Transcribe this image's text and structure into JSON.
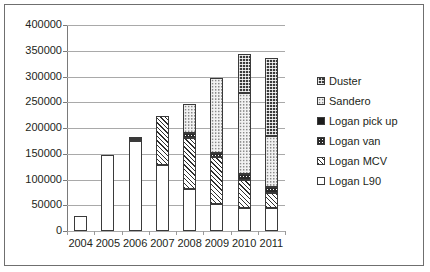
{
  "chart_data": {
    "type": "bar",
    "title": "",
    "xlabel": "",
    "ylabel": "",
    "stacked": true,
    "grid": true,
    "legend_position": "right",
    "ylim": [
      0,
      400000
    ],
    "ytick_step": 50000,
    "ytick_labels": [
      "400000",
      "350000",
      "300000",
      "250000",
      "200000",
      "150000",
      "100000",
      "50000",
      "0"
    ],
    "ytick_values": [
      400000,
      350000,
      300000,
      250000,
      200000,
      150000,
      100000,
      50000,
      0
    ],
    "categories": [
      "2004",
      "2005",
      "2006",
      "2007",
      "2008",
      "2009",
      "2010",
      "2011"
    ],
    "series": [
      {
        "name": "Logan L90",
        "pattern": "open",
        "values": [
          30000,
          148000,
          175000,
          128000,
          82000,
          52000,
          45000,
          45000
        ]
      },
      {
        "name": "Logan MCV",
        "pattern": "diagonal-hatch",
        "values": [
          0,
          0,
          4000,
          96000,
          98000,
          92000,
          55000,
          28000
        ]
      },
      {
        "name": "Logan van",
        "pattern": "dark-dotted",
        "values": [
          0,
          0,
          0,
          0,
          10000,
          8000,
          10000,
          12000
        ]
      },
      {
        "name": "Logan pick up",
        "pattern": "solid-dark",
        "values": [
          0,
          0,
          0,
          0,
          0,
          0,
          0,
          0
        ]
      },
      {
        "name": "Sandero",
        "pattern": "light-dotted",
        "values": [
          0,
          0,
          0,
          0,
          56000,
          146000,
          158000,
          99000
        ]
      },
      {
        "name": "Duster",
        "pattern": "checker-dark",
        "values": [
          0,
          0,
          2000,
          0,
          0,
          0,
          75000,
          152000
        ]
      }
    ],
    "totals": [
      30000,
      148000,
      181000,
      224000,
      246000,
      298000,
      343000,
      336000
    ]
  },
  "legend": {
    "items": [
      {
        "label": "Duster",
        "swatch": "checker-dark"
      },
      {
        "label": "Sandero",
        "swatch": "light-dotted"
      },
      {
        "label": "Logan pick up",
        "swatch": "solid-dark"
      },
      {
        "label": "Logan van",
        "swatch": "dark-dotted"
      },
      {
        "label": "Logan MCV",
        "swatch": "diagonal-hatch"
      },
      {
        "label": "Logan L90",
        "swatch": "open"
      }
    ]
  },
  "colors": {
    "frame": "#6f6f6f",
    "gridline": "#a9a9a9",
    "axis": "#7a7a7a",
    "text": "#231f20",
    "bar_outline": "#3a3a3a"
  }
}
